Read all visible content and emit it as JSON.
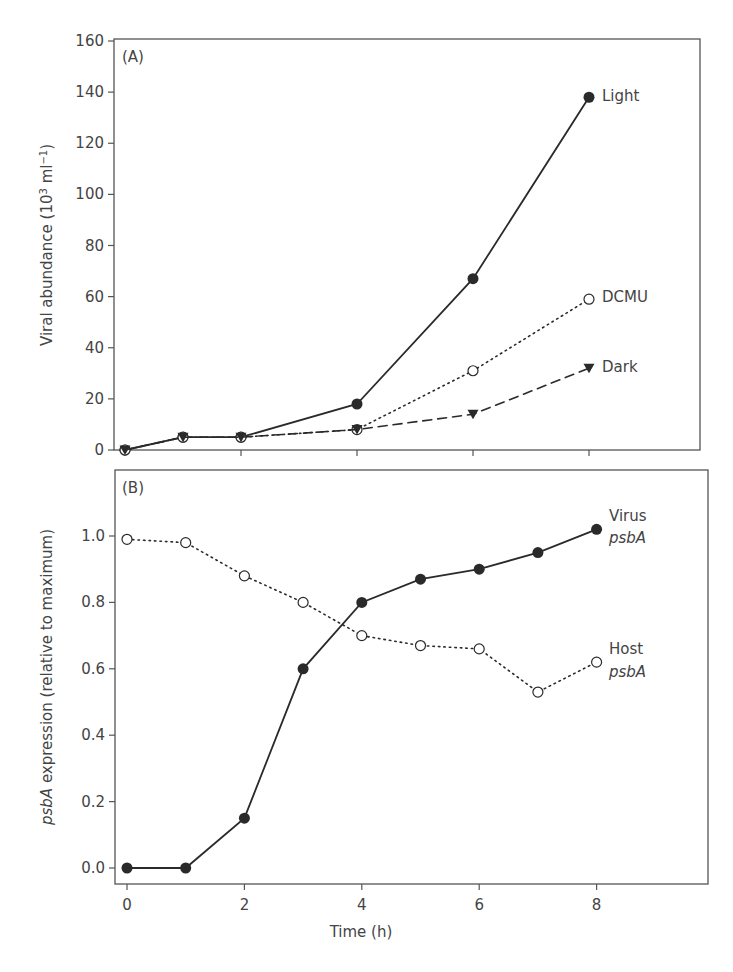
{
  "chart_data": [
    {
      "panel": "(A)",
      "type": "line",
      "title": "",
      "xlabel": "",
      "ylabel": "Viral abundance (10^3 ml^-1)",
      "ylabel_parts": {
        "main": "Viral abundance (10",
        "sup1": "3",
        "mid": " ml",
        "sup2": "−1",
        "end": ")"
      },
      "xlim": [
        -0.2,
        9.5
      ],
      "ylim": [
        0,
        160
      ],
      "yticks": [
        0,
        20,
        40,
        60,
        80,
        100,
        120,
        140,
        160
      ],
      "xticks": [
        0,
        2,
        4,
        6,
        8
      ],
      "grid": false,
      "legend": "inline labels at series ends",
      "series": [
        {
          "name": "Light",
          "marker": "filled-circle",
          "line": "solid",
          "x": [
            0,
            1,
            2,
            4,
            6,
            8
          ],
          "values": [
            0,
            5,
            5,
            18,
            67,
            138
          ]
        },
        {
          "name": "DCMU",
          "marker": "open-circle",
          "line": "dotted",
          "x": [
            0,
            1,
            2,
            4,
            6,
            8
          ],
          "values": [
            0,
            5,
            5,
            8,
            31,
            59
          ]
        },
        {
          "name": "Dark",
          "marker": "filled-triangle-down",
          "line": "dashed",
          "x": [
            0,
            1,
            2,
            4,
            6,
            8
          ],
          "values": [
            0,
            5,
            5,
            8,
            14,
            32
          ]
        }
      ]
    },
    {
      "panel": "(B)",
      "type": "line",
      "title": "",
      "xlabel": "Time (h)",
      "ylabel": "psbA expression (relative to maximum)",
      "ylabel_parts": {
        "italic": "psbA",
        "rest": " expression (relative to maximum)"
      },
      "xlim": [
        -0.2,
        9.5
      ],
      "ylim": [
        -0.05,
        1.17
      ],
      "yticks": [
        0.0,
        0.2,
        0.4,
        0.6,
        0.8,
        1.0
      ],
      "xticks": [
        0,
        2,
        4,
        6,
        8
      ],
      "grid": false,
      "legend": "inline labels at series ends",
      "series": [
        {
          "name": "Virus psbA",
          "label_line1": "Virus",
          "label_line2": "psbA",
          "marker": "filled-circle",
          "line": "solid",
          "x": [
            0,
            1,
            2,
            3,
            4,
            5,
            6,
            7,
            8
          ],
          "values": [
            0.0,
            0.0,
            0.15,
            0.6,
            0.8,
            0.87,
            0.9,
            0.95,
            1.02
          ]
        },
        {
          "name": "Host psbA",
          "label_line1": "Host",
          "label_line2": "psbA",
          "marker": "open-circle",
          "line": "dotted",
          "x": [
            0,
            1,
            2,
            3,
            4,
            5,
            6,
            7,
            8
          ],
          "values": [
            0.99,
            0.98,
            0.88,
            0.8,
            0.7,
            0.67,
            0.66,
            0.53,
            0.62
          ]
        }
      ]
    }
  ],
  "labels": {
    "panel_a": "(A)",
    "panel_b": "(B)",
    "a_ylabel_main": "Viral abundance (10",
    "a_ylabel_sup1": "3",
    "a_ylabel_mid": " ml",
    "a_ylabel_sup2": "−1",
    "a_ylabel_end": ")",
    "b_ylabel_italic": "psbA",
    "b_ylabel_rest": " expression (relative to maximum)",
    "xlabel": "Time (h)",
    "light": "Light",
    "dcmu": "DCMU",
    "dark": "Dark",
    "virus_1": "Virus",
    "virus_2": "psbA",
    "host_1": "Host",
    "host_2": "psbA"
  },
  "colors": {
    "line": "#2a2a2a",
    "axis": "#555555",
    "text": "#444444",
    "background": "#ffffff"
  }
}
